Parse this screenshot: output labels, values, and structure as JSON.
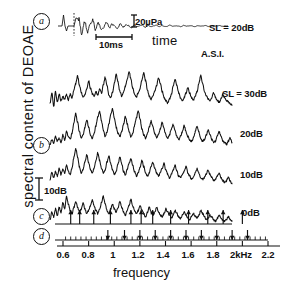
{
  "figure": {
    "y_axis_label": "spectral content of DEOAE",
    "x_axis_label": "frequency"
  },
  "panels": {
    "a": "a",
    "b": "b",
    "c": "c",
    "d": "d"
  },
  "annotations": {
    "amplitude_scale": "20µPa",
    "time_scale": "10ms",
    "time_axis": "time",
    "asi": "A.S.I.",
    "db_scale": "10dB",
    "level_20": "SL = 20dB",
    "level_30": "SL = 30dB",
    "level_20b": "20dB",
    "level_10": "10dB",
    "level_0": "0dB"
  },
  "chart_data": {
    "type": "line",
    "title": "",
    "xlabel": "frequency",
    "ylabel": "spectral content of DEOAE",
    "xlim": [
      0.55,
      2.25
    ],
    "xunit": "kHz",
    "grid": false,
    "legend": "right-side trace labels",
    "tick_labels": [
      "0.6",
      "0.8",
      "1",
      "1.2",
      "1.4",
      "1.6",
      "1.8",
      "2kHz",
      "2.2"
    ],
    "tick_values": [
      0.6,
      0.8,
      1.0,
      1.2,
      1.4,
      1.6,
      1.8,
      2.0,
      2.2
    ],
    "inset_timewave": {
      "type": "line",
      "xlabel": "time",
      "scale_bar_y": "20µPa",
      "scale_bar_x": "10ms",
      "label": "SL = 20dB"
    },
    "series": [
      {
        "name": "SL = 30dB",
        "label": "SL = 30dB",
        "offset_db": 30,
        "values": [
          3.0,
          6.5,
          2.0,
          7.0,
          3.5,
          6.0,
          4.0,
          5.2,
          4.6,
          5.8,
          4.2,
          6.0,
          5.0,
          7.5,
          9.5,
          12.0,
          9.0,
          6.5,
          5.0,
          6.0,
          7.5,
          10.5,
          8.0,
          6.2,
          5.4,
          7.0,
          5.8,
          7.8,
          6.4,
          9.0,
          11.5,
          9.0,
          6.0,
          5.0,
          6.5,
          9.5,
          12.5,
          10.0,
          7.0,
          5.5,
          6.8,
          8.5,
          11.0,
          13.5,
          11.0,
          8.0,
          6.0,
          5.2,
          6.5,
          8.0,
          10.5,
          13.0,
          10.5,
          7.5,
          5.5,
          4.5,
          5.5,
          7.0,
          9.0,
          11.5,
          9.5,
          7.0,
          5.0,
          4.0,
          3.2,
          4.5,
          6.0,
          8.5,
          11.0,
          9.0,
          6.5,
          4.8,
          4.0,
          5.0,
          6.5,
          8.0,
          6.5,
          5.0,
          4.2,
          5.5,
          7.0,
          9.5,
          12.0,
          9.5,
          7.0,
          5.5,
          4.5,
          4.0,
          5.0,
          6.5,
          5.0,
          4.0,
          3.5,
          4.5,
          6.0,
          5.0,
          4.0,
          3.5,
          3.0,
          2.5
        ]
      },
      {
        "name": "20dB",
        "label": "20dB",
        "offset_db": 20,
        "values": [
          2.5,
          4.0,
          3.0,
          5.0,
          3.5,
          4.5,
          3.0,
          5.5,
          4.0,
          6.5,
          5.0,
          4.0,
          6.0,
          9.5,
          12.5,
          9.5,
          6.5,
          4.5,
          5.5,
          8.0,
          10.5,
          8.0,
          5.5,
          4.5,
          6.0,
          8.5,
          11.5,
          13.0,
          10.0,
          7.0,
          5.0,
          6.5,
          9.0,
          12.0,
          14.0,
          11.0,
          8.0,
          6.0,
          5.0,
          6.5,
          9.0,
          11.5,
          9.0,
          6.5,
          5.0,
          6.0,
          8.5,
          11.0,
          13.5,
          10.5,
          7.5,
          5.5,
          4.5,
          6.0,
          8.0,
          10.0,
          8.0,
          6.0,
          4.5,
          5.5,
          7.5,
          9.5,
          7.5,
          5.5,
          4.5,
          5.5,
          7.5,
          9.0,
          7.0,
          5.0,
          4.0,
          5.0,
          6.5,
          8.5,
          6.5,
          5.0,
          4.0,
          3.5,
          4.5,
          6.5,
          8.5,
          6.5,
          4.5,
          3.5,
          4.0,
          5.5,
          7.0,
          5.5,
          4.0,
          3.0,
          3.5,
          5.0,
          6.5,
          5.0,
          3.5,
          3.0,
          2.5,
          3.5,
          4.5,
          3.0
        ]
      },
      {
        "name": "10dB",
        "label": "10dB",
        "offset_db": 10,
        "values": [
          3.5,
          5.5,
          4.0,
          6.0,
          4.5,
          7.0,
          5.0,
          6.5,
          5.5,
          8.0,
          6.0,
          5.0,
          7.0,
          10.5,
          13.5,
          10.5,
          7.5,
          5.5,
          6.5,
          9.0,
          11.5,
          9.0,
          6.5,
          5.5,
          7.0,
          9.5,
          12.0,
          9.5,
          7.0,
          5.5,
          6.5,
          9.0,
          11.0,
          8.5,
          6.5,
          5.0,
          6.0,
          8.5,
          10.5,
          8.5,
          6.0,
          5.0,
          6.5,
          8.5,
          10.0,
          8.0,
          6.0,
          4.5,
          5.5,
          7.5,
          9.5,
          7.5,
          5.5,
          4.5,
          5.5,
          7.5,
          9.0,
          7.0,
          5.5,
          4.5,
          5.5,
          7.0,
          8.5,
          6.5,
          5.0,
          4.0,
          5.0,
          6.5,
          8.0,
          6.0,
          4.5,
          4.0,
          5.0,
          6.0,
          7.5,
          5.5,
          4.5,
          3.5,
          4.0,
          5.5,
          7.0,
          5.5,
          4.0,
          3.5,
          4.0,
          5.0,
          6.5,
          5.0,
          4.0,
          3.0,
          3.5,
          4.5,
          5.5,
          4.0,
          3.0,
          2.5,
          3.0,
          4.0,
          3.0,
          2.0
        ]
      },
      {
        "name": "0dB",
        "label": "0dB",
        "offset_db": 0,
        "values": [
          2.0,
          4.5,
          3.0,
          5.5,
          3.5,
          6.0,
          4.5,
          7.5,
          5.5,
          9.5,
          7.0,
          5.0,
          4.0,
          6.0,
          8.0,
          6.0,
          4.5,
          5.5,
          7.5,
          5.5,
          4.0,
          5.0,
          6.5,
          8.5,
          6.5,
          5.0,
          4.0,
          5.5,
          7.5,
          9.5,
          7.0,
          5.0,
          4.0,
          5.5,
          7.0,
          5.5,
          4.5,
          6.0,
          8.0,
          6.0,
          4.5,
          3.5,
          5.0,
          6.5,
          8.5,
          6.5,
          5.0,
          4.0,
          5.0,
          6.5,
          5.0,
          4.0,
          3.0,
          4.5,
          6.0,
          4.5,
          3.5,
          4.5,
          6.0,
          4.5,
          3.5,
          3.0,
          4.0,
          5.5,
          4.5,
          3.5,
          2.5,
          3.5,
          5.0,
          4.0,
          3.0,
          2.5,
          3.5,
          4.5,
          3.5,
          2.5,
          2.0,
          3.0,
          4.0,
          3.0,
          2.5,
          3.5,
          5.0,
          4.0,
          3.0,
          2.0,
          2.5,
          3.5,
          3.0,
          2.0,
          1.5,
          2.5,
          3.5,
          2.5,
          2.0,
          1.5,
          2.0,
          3.0,
          2.0,
          1.5
        ]
      }
    ],
    "panel_c_arrow_frequencies": [
      0.66,
      0.73,
      0.84,
      0.97,
      1.13,
      1.21,
      1.3,
      1.44,
      1.58,
      1.73,
      1.85,
      2.0
    ],
    "panel_d_arrow_frequencies": [
      0.95,
      1.08,
      1.2,
      1.32,
      1.44,
      1.56,
      1.68,
      1.8,
      1.92,
      2.04
    ]
  }
}
